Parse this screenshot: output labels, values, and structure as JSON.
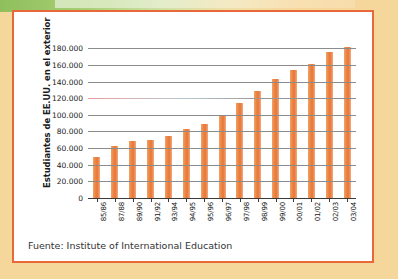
{
  "figure": {
    "frame_color": "#e8683a",
    "page_background": "#f6d79b",
    "card_background": "#ffffff",
    "bar_color": "#ed8a46",
    "source_note": "Fuente: Institute of International Education"
  },
  "chart_data": {
    "type": "bar",
    "title": "",
    "subtitle": "",
    "xlabel": "",
    "ylabel": "Estudiantes de EE.UU. en el exterior",
    "categories": [
      "85/86",
      "87/88",
      "89/90",
      "91/92",
      "93/94",
      "94/95",
      "95/96",
      "96/97",
      "97/98",
      "98/99",
      "99/00",
      "00/01",
      "01/02",
      "02/03",
      "03/04"
    ],
    "values": [
      49000,
      62000,
      68000,
      70000,
      75000,
      83000,
      89000,
      100000,
      114000,
      129000,
      143000,
      154000,
      161000,
      175000,
      181000
    ],
    "ylim": [
      0,
      190000
    ],
    "ytick_values": [
      0,
      20000,
      40000,
      60000,
      80000,
      100000,
      120000,
      140000,
      160000,
      180000
    ],
    "ytick_labels": [
      "0",
      "20.000",
      "40.000",
      "60.000",
      "80.000",
      "100.000",
      "120.000",
      "140.000",
      "160.000",
      "180.000"
    ],
    "grid": true,
    "legend": false,
    "legend_position": "none",
    "annotations": [
      "Fuente: Institute of International Education"
    ]
  }
}
